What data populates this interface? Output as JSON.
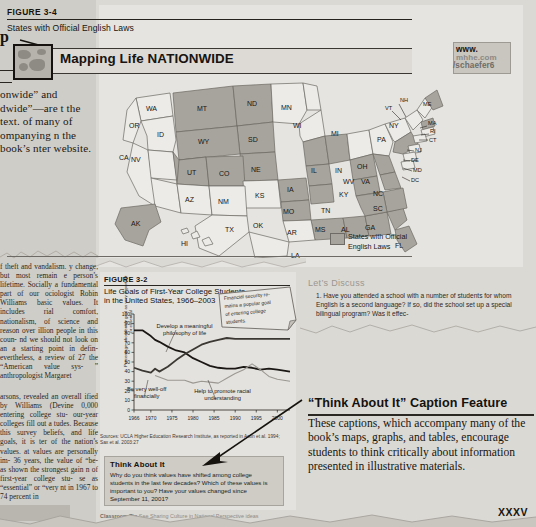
{
  "left_column": {
    "heading_fragment": "p",
    "intro_text": "onwide” and dwide”—are t the text. of many of ompanying n the book’s nter website.",
    "body_text_1": "f theft and vandalism. y change, but most remain e person’s lifetime. Socially a fundamental part of our ociologist Robin Williams basic values. It includes rial comfort, nationalism, of science and reason over illion people in this coun- nd we should not look on an a starting point in defin- evertheless, a review of 27 the “American value sys- ” anthropologist Margaret",
    "body_text_2": "arsons, revealed an overall ified by Williams (Devine 0,000 entering college stu- our-year colleges fill out a tudes. Because this survey beliefs, and life goals, it is ter of the nation’s values. at values are personally im- 36 years, the value of “be- as shown the strongest gain n of first-year college stu- se as “essential” or “very nt in 1967 to 74 percent in"
  },
  "figure_34": {
    "label": "FIGURE 3-4",
    "title": "States with Official English Laws",
    "banner_text": "Mapping Life NATIONWIDE",
    "web_line1": "www.",
    "web_line2": "mhhe.com",
    "web_line3": "/schaefer6",
    "legend_label": "States with Official\nEnglish Laws",
    "legend_line1": "States with Official",
    "legend_line2": "English Laws",
    "states_with_law": [
      "MT",
      "ND",
      "SD",
      "WY",
      "NE",
      "UT",
      "CO",
      "CA",
      "AK",
      "IA",
      "MO",
      "AR",
      "MS",
      "AL",
      "GA",
      "SC",
      "NC",
      "TN",
      "KY",
      "IN",
      "IL",
      "VA",
      "WV",
      "FL",
      "NH",
      "MA",
      "PA"
    ],
    "state_labels": [
      "WA",
      "OR",
      "ID",
      "MT",
      "ND",
      "MN",
      "WI",
      "MI",
      "NY",
      "VT",
      "NH",
      "ME",
      "MA",
      "RI",
      "CT",
      "NJ",
      "PA",
      "DE",
      "MD",
      "DC",
      "OH",
      "IN",
      "IL",
      "IA",
      "SD",
      "WY",
      "NE",
      "NV",
      "UT",
      "CO",
      "KS",
      "MO",
      "KY",
      "WV",
      "VA",
      "NC",
      "TN",
      "AR",
      "OK",
      "NM",
      "AZ",
      "CA",
      "TX",
      "LA",
      "MS",
      "AL",
      "GA",
      "SC",
      "FL",
      "AK",
      "HI"
    ]
  },
  "figure_32": {
    "label": "FIGURE 3-2",
    "title_line1": "Life Goals of First-Year College Students",
    "title_line2": "in the United States, 1966–2003",
    "callout": "Financial security remains a popular goal of entering college students.",
    "source": "Sources: UCLA Higher Education Research Institute, as reported in Astin et al. 1994; Sax et al. 2003:27",
    "think_heading": "Think About It",
    "think_body": "Why do you think values have shifted among college students in the last few decades? Which of these values is important to you? Have your values changed since September 11, 2001?"
  },
  "chart_data": {
    "type": "line",
    "title": "Life Goals of First-Year College Students in the United States, 1966–2003",
    "xlabel": "",
    "ylabel": "Percentage who identify goal as very important or essential",
    "xlim": [
      1966,
      2003
    ],
    "ylim": [
      0,
      100
    ],
    "ytick_labels": [
      "0",
      "10",
      "20",
      "30",
      "40",
      "50",
      "60",
      "70",
      "80",
      "90",
      "100"
    ],
    "yticks": [
      0,
      10,
      20,
      30,
      40,
      50,
      60,
      70,
      80,
      90,
      100
    ],
    "xtick_labels": [
      "1966",
      "1970",
      "1975",
      "1980",
      "1985",
      "1990",
      "1995",
      "2000"
    ],
    "xticks": [
      1966,
      1970,
      1975,
      1980,
      1985,
      1990,
      1995,
      2000
    ],
    "grid": false,
    "legend_position": "inline-annotations",
    "series": [
      {
        "name": "Develop a meaningful philosophy of life",
        "color": "#1a1714",
        "x": [
          1966,
          1968,
          1970,
          1971,
          1972,
          1974,
          1976,
          1978,
          1980,
          1982,
          1984,
          1986,
          1988,
          1990,
          1992,
          1994,
          1996,
          1998,
          2000,
          2003
        ],
        "values": [
          83,
          83,
          77,
          73,
          71,
          66,
          62,
          60,
          54,
          50,
          46,
          44,
          43,
          43,
          45,
          44,
          42,
          43,
          42,
          40
        ]
      },
      {
        "name": "Be very well-off financially",
        "color": "#3b3833",
        "x": [
          1966,
          1968,
          1970,
          1971,
          1972,
          1974,
          1976,
          1978,
          1980,
          1982,
          1984,
          1986,
          1988,
          1990,
          1992,
          1994,
          1996,
          1998,
          2000,
          2003
        ],
        "values": [
          44,
          41,
          39,
          43,
          40,
          45,
          52,
          58,
          63,
          68,
          71,
          73,
          75,
          74,
          74,
          74,
          74,
          74,
          74,
          74
        ]
      },
      {
        "name": "Help to promote racial understanding",
        "color": "#9b9892",
        "x": [
          1971,
          1974,
          1976,
          1978,
          1980,
          1982,
          1984,
          1986,
          1988,
          1990,
          1992,
          1994,
          1996,
          1998,
          2000,
          2003
        ],
        "values": [
          36,
          31,
          31,
          31,
          28,
          30,
          29,
          28,
          33,
          38,
          42,
          48,
          42,
          35,
          32,
          30
        ]
      }
    ],
    "annotations": [
      {
        "text": "Develop a meaningful philosophy of life",
        "x": 1978,
        "y": 85
      },
      {
        "text": "Be very well-off financially",
        "x": 1969,
        "y": 20
      },
      {
        "text": "Help to promote racial understanding",
        "x": 1987,
        "y": 18
      }
    ]
  },
  "lets_discuss": {
    "heading": "Let’s Discuss",
    "item_number": "1.",
    "item_text": "Have you attended a school with a number of students for whom English is a second language? If so, did the school set up a special bilingual program? Was it effec-"
  },
  "caption_feature": {
    "heading": "“Think About It” Caption Feature",
    "body": "These captions, which accompany many of the book’s maps, graphs, and tables, encourage students to think critically about information presented in illustrative materials."
  },
  "footer": {
    "folio": "XXXV",
    "classroom_tip_label": "Classroom Tip",
    "classroom_tip_text": "See Sharing Culture in National Perspective ideas"
  }
}
